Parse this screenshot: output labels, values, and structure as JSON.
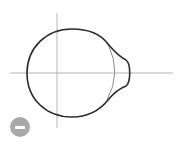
{
  "diagram": {
    "colors": {
      "outline": "#2b2b2b",
      "axes": "#b5b5b5",
      "inner_arc": "#8a8a8a",
      "button": "#a9a9a9"
    }
  },
  "controls": {
    "zoom_out_icon": "minus-icon"
  }
}
